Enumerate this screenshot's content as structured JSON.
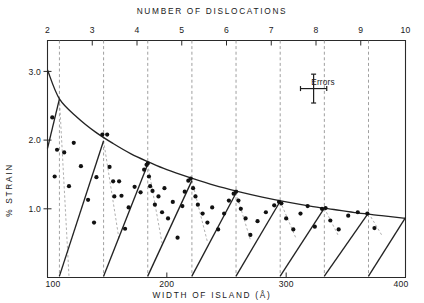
{
  "figure": {
    "top_axis_title": "NUMBER  OF  DISLOCATIONS",
    "bottom_axis_title": "WIDTH  OF  ISLAND (Å)",
    "left_axis_title": "% STRAIN",
    "errors_label": "Errors"
  },
  "chart_data": {
    "type": "scatter",
    "title": "",
    "subtitle": "",
    "xlabel": "WIDTH  OF  ISLAND (Å)",
    "ylabel": "% STRAIN",
    "x2label": "NUMBER  OF  DISLOCATIONS",
    "grid": true,
    "legend_position": "top-right",
    "xlim": [
      100,
      400
    ],
    "ylim": [
      0,
      3.45
    ],
    "x2lim": [
      2,
      10
    ],
    "xticks": [
      100,
      200,
      300,
      400
    ],
    "xticklabels": [
      "100",
      "200",
      "300",
      "400"
    ],
    "yticks": [
      1.0,
      2.0,
      3.0
    ],
    "yticklabels": [
      "1.0",
      "2.0",
      "3.0"
    ],
    "x2ticks": [
      2,
      3,
      4,
      5,
      6,
      7,
      8,
      9,
      10
    ],
    "x2ticklabels": [
      "2",
      "3",
      "4",
      "5",
      "6",
      "7",
      "8",
      "9",
      "10"
    ],
    "gridlines_x": [
      110,
      147,
      184,
      221,
      258,
      295,
      332,
      369
    ],
    "annotations": [
      {
        "text": "Errors",
        "x": 323,
        "y": 2.75,
        "type": "errorbar-legend",
        "x_halfwidth": 11,
        "y_halfheight": 0.21
      }
    ],
    "series": [
      {
        "name": "envelope",
        "type": "line",
        "comment": "smooth monotonically-decreasing upper bound curve",
        "points": [
          [
            100,
            3.02
          ],
          [
            110,
            2.6
          ],
          [
            125,
            2.33
          ],
          [
            140,
            2.12
          ],
          [
            155,
            1.95
          ],
          [
            170,
            1.8
          ],
          [
            185,
            1.68
          ],
          [
            200,
            1.57
          ],
          [
            220,
            1.45
          ],
          [
            240,
            1.34
          ],
          [
            260,
            1.25
          ],
          [
            280,
            1.17
          ],
          [
            300,
            1.1
          ],
          [
            320,
            1.04
          ],
          [
            340,
            0.99
          ],
          [
            360,
            0.94
          ],
          [
            380,
            0.9
          ],
          [
            400,
            0.86
          ]
        ]
      },
      {
        "name": "sawtooth",
        "type": "line",
        "comment": "relaxation sawtooth: rises from zero strain to envelope at each dislocation-addition width",
        "segments": [
          [
            [
              100,
              1.88
            ],
            [
              110,
              2.6
            ]
          ],
          [
            [
              110,
              0.02
            ],
            [
              147,
              1.99
            ]
          ],
          [
            [
              147,
              0.02
            ],
            [
              184,
              1.65
            ]
          ],
          [
            [
              184,
              0.02
            ],
            [
              221,
              1.41
            ]
          ],
          [
            [
              221,
              0.02
            ],
            [
              258,
              1.23
            ]
          ],
          [
            [
              258,
              0.02
            ],
            [
              295,
              1.11
            ]
          ],
          [
            [
              295,
              0.02
            ],
            [
              332,
              1.01
            ]
          ],
          [
            [
              332,
              0.02
            ],
            [
              369,
              0.94
            ]
          ],
          [
            [
              369,
              0.02
            ],
            [
              400,
              0.87
            ]
          ]
        ]
      },
      {
        "name": "relaxation leaders",
        "type": "line",
        "comment": "faint dashed drop lines from each sawtooth peak",
        "segments": [
          [
            [
              110,
              2.6
            ],
            [
              118,
              0.02
            ]
          ],
          [
            [
              147,
              1.99
            ],
            [
              160,
              0.55
            ]
          ],
          [
            [
              184,
              1.65
            ],
            [
              196,
              0.5
            ]
          ],
          [
            [
              221,
              1.41
            ],
            [
              234,
              0.52
            ]
          ],
          [
            [
              258,
              1.23
            ],
            [
              270,
              0.55
            ]
          ],
          [
            [
              295,
              1.11
            ],
            [
              308,
              0.58
            ]
          ],
          [
            [
              332,
              1.01
            ],
            [
              344,
              0.6
            ]
          ],
          [
            [
              369,
              0.94
            ],
            [
              380,
              0.62
            ]
          ]
        ]
      },
      {
        "name": "measurements",
        "type": "scatter",
        "marker": "filled-circle",
        "points": [
          [
            104,
            2.33
          ],
          [
            106,
            1.47
          ],
          [
            108,
            1.86
          ],
          [
            114,
            1.82
          ],
          [
            118,
            1.33
          ],
          [
            122,
            1.96
          ],
          [
            128,
            1.62
          ],
          [
            134,
            1.13
          ],
          [
            139,
            0.8
          ],
          [
            141,
            1.46
          ],
          [
            146,
            2.08
          ],
          [
            150,
            2.08
          ],
          [
            152,
            1.61
          ],
          [
            155,
            1.4
          ],
          [
            156,
            1.18
          ],
          [
            160,
            1.4
          ],
          [
            162,
            1.19
          ],
          [
            165,
            0.71
          ],
          [
            168,
            1.02
          ],
          [
            173,
            1.32
          ],
          [
            178,
            1.24
          ],
          [
            181,
            1.57
          ],
          [
            183,
            1.64
          ],
          [
            184,
            1.66
          ],
          [
            185,
            1.47
          ],
          [
            186,
            1.33
          ],
          [
            188,
            1.26
          ],
          [
            190,
            1.06
          ],
          [
            193,
            1.18
          ],
          [
            196,
            0.95
          ],
          [
            198,
            1.3
          ],
          [
            201,
            0.86
          ],
          [
            205,
            1.1
          ],
          [
            209,
            0.58
          ],
          [
            213,
            1.04
          ],
          [
            215,
            1.25
          ],
          [
            218,
            1.41
          ],
          [
            220,
            1.44
          ],
          [
            222,
            1.3
          ],
          [
            224,
            1.18
          ],
          [
            226,
            1.06
          ],
          [
            230,
            0.93
          ],
          [
            234,
            0.8
          ],
          [
            238,
            1.02
          ],
          [
            243,
            0.7
          ],
          [
            248,
            0.93
          ],
          [
            252,
            1.12
          ],
          [
            256,
            1.22
          ],
          [
            258,
            1.25
          ],
          [
            260,
            1.12
          ],
          [
            262,
            1.0
          ],
          [
            266,
            0.86
          ],
          [
            270,
            0.62
          ],
          [
            276,
            0.82
          ],
          [
            283,
            0.95
          ],
          [
            290,
            1.05
          ],
          [
            294,
            1.1
          ],
          [
            296,
            1.08
          ],
          [
            300,
            0.86
          ],
          [
            306,
            0.7
          ],
          [
            312,
            0.93
          ],
          [
            318,
            1.04
          ],
          [
            324,
            0.74
          ],
          [
            330,
            1.0
          ],
          [
            333,
            1.01
          ],
          [
            337,
            0.83
          ],
          [
            344,
            0.7
          ],
          [
            352,
            0.9
          ],
          [
            360,
            0.95
          ],
          [
            368,
            0.93
          ],
          [
            374,
            0.72
          ]
        ]
      }
    ]
  }
}
